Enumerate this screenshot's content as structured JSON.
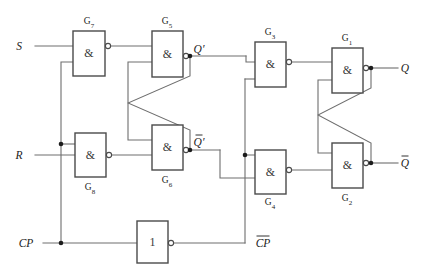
{
  "diagram": {
    "type": "logic-circuit",
    "width": 424,
    "height": 274,
    "colors": {
      "background": "#ffffff",
      "wire": "#6e6e6e",
      "gate_outline": "#4a4a4a",
      "text": "#1c1c1c",
      "junction": "#1c1c1c"
    }
  },
  "inputs": [
    {
      "id": "S",
      "label": "S",
      "x": 19,
      "y": 46
    },
    {
      "id": "R",
      "label": "R",
      "x": 19,
      "y": 155
    },
    {
      "id": "CP",
      "label": "CP",
      "x": 26,
      "y": 243
    }
  ],
  "outputs": [
    {
      "id": "Q",
      "label": "Q",
      "bar": false,
      "x": 405,
      "y": 68
    },
    {
      "id": "Qbar",
      "label": "Q",
      "bar": true,
      "x": 405,
      "y": 163
    }
  ],
  "internal_signals": [
    {
      "id": "Qp",
      "label": "Q",
      "bar": false,
      "prime": true,
      "x": 199,
      "y": 49
    },
    {
      "id": "Qbarp",
      "label": "Q",
      "bar": true,
      "prime": true,
      "x": 199,
      "y": 142
    },
    {
      "id": "CPbar",
      "label": "CP",
      "bar": true,
      "prime": false,
      "x": 263,
      "y": 243
    }
  ],
  "gates": [
    {
      "id": "G7",
      "symbol": "&",
      "label": "G",
      "sub": "7",
      "label_pos": "top",
      "x": 73,
      "y": 31,
      "w": 32,
      "h": 45,
      "out_x": 108,
      "out_y": 46,
      "label_x": 89,
      "label_y": 24
    },
    {
      "id": "G5",
      "symbol": "&",
      "label": "G",
      "sub": "5",
      "label_pos": "top",
      "x": 152,
      "y": 31,
      "w": 31,
      "h": 46,
      "out_x": 186,
      "out_y": 56,
      "label_x": 167,
      "label_y": 24
    },
    {
      "id": "G3",
      "symbol": "&",
      "label": "G",
      "sub": "3",
      "label_pos": "top",
      "x": 255,
      "y": 42,
      "w": 31,
      "h": 45,
      "out_x": 289,
      "out_y": 62,
      "label_x": 270,
      "label_y": 35
    },
    {
      "id": "G1",
      "symbol": "&",
      "label": "G",
      "sub": "1",
      "label_pos": "top",
      "x": 332,
      "y": 48,
      "w": 31,
      "h": 45,
      "out_x": 366,
      "out_y": 68,
      "label_x": 347,
      "label_y": 41
    },
    {
      "id": "G8",
      "symbol": "&",
      "label": "G",
      "sub": "8",
      "label_pos": "bottom",
      "x": 75,
      "y": 133,
      "w": 31,
      "h": 44,
      "out_x": 109,
      "out_y": 155,
      "label_x": 90,
      "label_y": 190
    },
    {
      "id": "G6",
      "symbol": "&",
      "label": "G",
      "sub": "6",
      "label_pos": "bottom",
      "x": 152,
      "y": 125,
      "w": 31,
      "h": 45,
      "out_x": 186,
      "out_y": 150,
      "label_x": 167,
      "label_y": 183
    },
    {
      "id": "G4",
      "symbol": "&",
      "label": "G",
      "sub": "4",
      "label_pos": "bottom",
      "x": 255,
      "y": 150,
      "w": 31,
      "h": 44,
      "out_x": 289,
      "out_y": 170,
      "label_x": 270,
      "label_y": 205
    },
    {
      "id": "G2",
      "symbol": "&",
      "label": "G",
      "sub": "2",
      "label_pos": "bottom",
      "x": 332,
      "y": 143,
      "w": 31,
      "h": 45,
      "out_x": 366,
      "out_y": 163,
      "label_x": 347,
      "label_y": 201
    },
    {
      "id": "INV",
      "symbol": "1",
      "label": "",
      "sub": "",
      "label_pos": "none",
      "x": 137,
      "y": 221,
      "w": 31,
      "h": 42,
      "out_x": 171,
      "out_y": 243,
      "label_x": 152,
      "label_y": 215
    }
  ],
  "junction_dots": [
    {
      "x": 61,
      "y": 243
    },
    {
      "x": 61,
      "y": 144
    },
    {
      "x": 190,
      "y": 56
    },
    {
      "x": 190,
      "y": 150
    },
    {
      "x": 245,
      "y": 155
    },
    {
      "x": 371,
      "y": 68
    },
    {
      "x": 371,
      "y": 163
    }
  ],
  "wires": [
    {
      "id": "s-in",
      "d": "M 35 46 L 73 46"
    },
    {
      "id": "r-in",
      "d": "M 35 155 L 75 155"
    },
    {
      "id": "cp-in",
      "d": "M 43 243 L 137 243"
    },
    {
      "id": "cp-to-g7",
      "d": "M 61 243 L 61 62 L 73 62"
    },
    {
      "id": "cp-to-g8",
      "d": "M 61 144 L 75 144"
    },
    {
      "id": "g7-out",
      "d": "M 111 46 L 152 46"
    },
    {
      "id": "g8-out",
      "d": "M 112 155 L 152 155"
    },
    {
      "id": "g5-out",
      "d": "M 189 56 L 246 56"
    },
    {
      "id": "g6-out",
      "d": "M 189 150 L 220 150"
    },
    {
      "id": "cross-a",
      "d": "M 152 62 L 128 62 L 128 103 L 190 130 L 190 150"
    },
    {
      "id": "cross-b",
      "d": "M 152 140 L 128 140 L 128 103 L 190 76 L 190 56"
    },
    {
      "id": "g6-to-g4",
      "d": "M 220 150 L 220 178 L 255 178"
    },
    {
      "id": "g5-to-g3",
      "d": "M 246 56 L 246 62 L 255 62"
    },
    {
      "id": "cpbar-out",
      "d": "M 174 243 L 245 243"
    },
    {
      "id": "cpbar-up",
      "d": "M 245 243 L 245 155 L 255 155"
    },
    {
      "id": "cpbar-g3",
      "d": "M 245 79 L 255 79"
    },
    {
      "id": "cpbar-seg",
      "d": "M 245 155 L 245 79"
    },
    {
      "id": "g3-out",
      "d": "M 292 62 L 332 62"
    },
    {
      "id": "g4-out",
      "d": "M 292 170 L 332 170"
    },
    {
      "id": "g1-out",
      "d": "M 369 68 L 398 68"
    },
    {
      "id": "g2-out",
      "d": "M 369 163 L 398 163"
    },
    {
      "id": "cross-c",
      "d": "M 332 80 L 318 80 L 318 115 L 371 143 L 371 163"
    },
    {
      "id": "cross-d",
      "d": "M 332 153 L 318 153 L 318 115 L 371 88 L 371 68"
    }
  ]
}
